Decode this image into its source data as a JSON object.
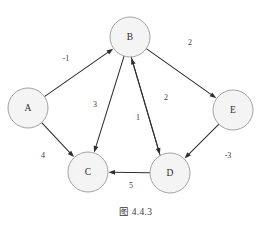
{
  "figure": {
    "caption": "图 4.4.3",
    "background_color": "#ffffff",
    "node_fill": "#f4f4f4",
    "node_stroke": "#9a9a9a",
    "edge_color": "#2f2f2f",
    "text_color": "#3a3a3a"
  },
  "graph": {
    "type": "directed-weighted-graph",
    "node_radius": 20,
    "nodes": [
      {
        "id": "A",
        "label": "A",
        "x": 28,
        "y": 108
      },
      {
        "id": "B",
        "label": "B",
        "x": 130,
        "y": 37
      },
      {
        "id": "C",
        "label": "C",
        "x": 88,
        "y": 172
      },
      {
        "id": "D",
        "label": "D",
        "x": 170,
        "y": 173
      },
      {
        "id": "E",
        "label": "E",
        "x": 233,
        "y": 110
      }
    ],
    "edges": [
      {
        "from": "A",
        "to": "B",
        "weight": "-1",
        "label_x": 66,
        "label_y": 58
      },
      {
        "from": "A",
        "to": "C",
        "weight": "4",
        "label_x": 43,
        "label_y": 155
      },
      {
        "from": "B",
        "to": "C",
        "weight": "3",
        "label_x": 95,
        "label_y": 104
      },
      {
        "from": "B",
        "to": "D",
        "weight": "2",
        "label_x": 166,
        "label_y": 97
      },
      {
        "from": "B",
        "to": "E",
        "weight": "2",
        "label_x": 190,
        "label_y": 42
      },
      {
        "from": "D",
        "to": "B",
        "weight": "1",
        "label_x": 138,
        "label_y": 117
      },
      {
        "from": "D",
        "to": "C",
        "weight": "5",
        "label_x": 131,
        "label_y": 185
      },
      {
        "from": "E",
        "to": "D",
        "weight": "-3",
        "label_x": 228,
        "label_y": 155
      }
    ]
  }
}
